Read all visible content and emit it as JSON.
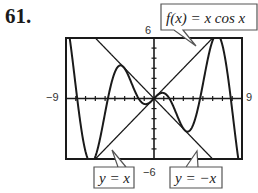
{
  "problem_number": "61.",
  "chart_data": {
    "type": "line",
    "title": "",
    "xlabel": "",
    "ylabel": "",
    "xlim": [
      -9,
      9
    ],
    "ylim": [
      -6,
      6
    ],
    "x_tick_labels": [
      "-9",
      "9"
    ],
    "y_tick_labels": [
      "-6",
      "6"
    ],
    "x_tick_step": 1,
    "y_tick_step": 1,
    "grid": false,
    "series": [
      {
        "name": "f(x) = x cos x",
        "expression": "x*cos(x)"
      },
      {
        "name": "y = x",
        "expression": "x"
      },
      {
        "name": "y = -x",
        "expression": "-x"
      }
    ],
    "annotations": [
      {
        "text": "f(x) = x cos x",
        "points_to": "f(x)"
      },
      {
        "text": "y = x",
        "points_to": "y = x"
      },
      {
        "text": "y = −x",
        "points_to": "y = -x"
      }
    ]
  },
  "labels": {
    "xmin": "−9",
    "xmax": "9",
    "ymin": "−6",
    "ymax": "6",
    "callout_f": "f(x) = x cos x",
    "callout_y_eq_x": "y = x",
    "callout_y_eq_neg_x": "y = −x"
  },
  "colors": {
    "curve": "#1a1a1a",
    "frame": "#1a1a1a",
    "callout_border": "#555555"
  }
}
